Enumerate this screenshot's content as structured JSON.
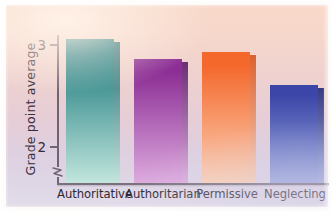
{
  "chart_data": {
    "type": "bar",
    "title": "",
    "xlabel": "",
    "ylabel": "Grade point average",
    "categories": [
      "Authoritative",
      "Authoritarian",
      "Permissive",
      "Neglecting"
    ],
    "values": [
      3.05,
      2.85,
      2.92,
      2.6
    ],
    "ylim": [
      1.78,
      3.28
    ],
    "yticks": [
      2,
      3
    ],
    "ytick_labels": [
      "2",
      "3"
    ],
    "axis_break": true,
    "grid": false,
    "legend": null,
    "series": [
      {
        "name": "Grade point average",
        "values": [
          3.05,
          2.85,
          2.92,
          2.6
        ]
      }
    ],
    "bar_colors": [
      "#1f7d80",
      "#8e2f96",
      "#f2682e",
      "#3c47a8"
    ],
    "bar_colors_bottom": [
      "#bfe4dc",
      "#dba7dd",
      "#fbcdb2",
      "#9aa7dd"
    ]
  },
  "axis": {
    "y_title": "Grade point average",
    "tick_top_label": "3",
    "tick_bottom_label": "2"
  },
  "bars": [
    {
      "label": "Authoritative",
      "value": 3.05,
      "top_color": "#1d7b7e",
      "bottom_color": "#c2e6dd",
      "side_color": "#0f5f66"
    },
    {
      "label": "Authoritarian",
      "value": 2.85,
      "top_color": "#8c2e95",
      "bottom_color": "#ddaade",
      "side_color": "#5d1a6b"
    },
    {
      "label": "Permissive",
      "value": 2.92,
      "top_color": "#f4682c",
      "bottom_color": "#fcd1b6",
      "side_color": "#d8551f"
    },
    {
      "label": "Neglecting",
      "value": 2.6,
      "top_color": "#3b46a8",
      "bottom_color": "#9ba8de",
      "side_color": "#232c7a"
    }
  ],
  "colors": {
    "background_top": "#f8d9c9",
    "background_bottom": "#e2dce9",
    "axis": "#6f6472",
    "text": "#2f2833"
  }
}
